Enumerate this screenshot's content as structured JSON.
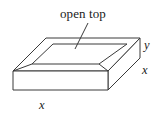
{
  "figure": {
    "canvas": {
      "width": 163,
      "height": 118
    },
    "background_color": "#ffffff",
    "stroke_color": "#3a3a3a",
    "text_color": "#1b1b1b",
    "annotations": {
      "open_top_label": "open top",
      "depth_label_y": "y",
      "side_label_x": "x",
      "front_label_x": "x"
    },
    "geometry": {
      "outer_rim": {
        "top_left": [
          46,
          38
        ],
        "top_right": [
          140,
          38
        ],
        "bottom_right": [
          108,
          71
        ],
        "bottom_left": [
          13,
          71
        ]
      },
      "inner_opening": {
        "top_left": [
          53,
          44
        ],
        "top_right": [
          127,
          44
        ],
        "bottom_right": [
          99,
          64
        ],
        "bottom_left": [
          32,
          64
        ]
      },
      "front_face": {
        "top_left": [
          13,
          71
        ],
        "top_right": [
          108,
          71
        ],
        "bottom_right": [
          108,
          90
        ],
        "bottom_left": [
          13,
          90
        ]
      },
      "right_face": {
        "front_top": [
          108,
          71
        ],
        "back_top": [
          140,
          38
        ],
        "back_bottom": [
          140,
          58
        ],
        "front_bottom": [
          108,
          90
        ]
      },
      "leader_line": {
        "from": [
          88,
          23
        ],
        "to": [
          75,
          49
        ]
      }
    },
    "label_positions": {
      "open_top": [
        95,
        14
      ],
      "y": [
        147,
        45
      ],
      "x_side": [
        145,
        70
      ],
      "x_front": [
        43,
        105
      ]
    }
  }
}
